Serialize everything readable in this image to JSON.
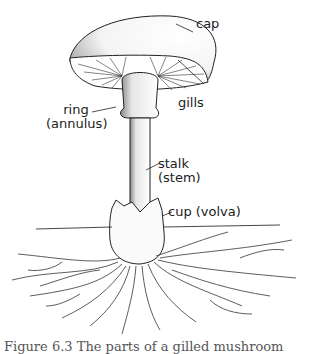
{
  "diagram": {
    "labels": {
      "cap": "cap",
      "gills": "gills",
      "ring_line1": "ring",
      "ring_line2": "(annulus)",
      "stalk_line1": "stalk",
      "stalk_line2": "(stem)",
      "cup": "cup (volva)"
    },
    "caption": "Figure 6.3 The parts of a gilled mushroom"
  }
}
